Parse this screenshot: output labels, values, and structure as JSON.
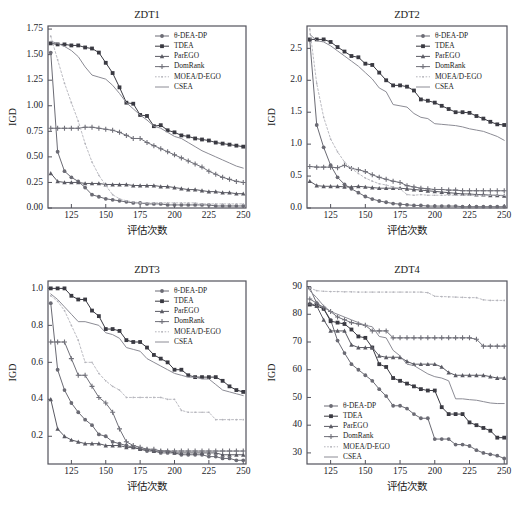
{
  "figure": {
    "axis_x_label": "评估次数",
    "axis_y_label": "IGD"
  },
  "legend": {
    "entries": [
      {
        "label": "θ-DEA-DP",
        "marker": "circle",
        "color": "#6b6b74",
        "dashed": false
      },
      {
        "label": "TDEA",
        "marker": "square",
        "color": "#3a3a42",
        "dashed": false
      },
      {
        "label": "ParEGO",
        "marker": "triangle",
        "color": "#5a5a63",
        "dashed": false
      },
      {
        "label": "DomRank",
        "marker": "plus",
        "color": "#707079",
        "dashed": false
      },
      {
        "label": "MOEA/D-EGO",
        "marker": "dot",
        "color": "#b4b4bb",
        "dashed": true
      },
      {
        "label": "CSEA",
        "marker": "none",
        "color": "#8c8c95",
        "dashed": false
      }
    ]
  },
  "chart_data": [
    {
      "type": "line",
      "title": "ZDT1",
      "xlabel": "评估次数",
      "ylabel": "IGD",
      "xlim": [
        108,
        252
      ],
      "ylim": [
        0.0,
        1.78
      ],
      "xticks": [
        125,
        150,
        175,
        200,
        225,
        250
      ],
      "yticks": [
        0.0,
        0.25,
        0.5,
        0.75,
        1.0,
        1.25,
        1.5,
        1.75
      ],
      "ytick_labels": [
        "0.00",
        "0.25",
        "0.50",
        "0.75",
        "1.00",
        "1.25",
        "1.50",
        "1.75"
      ],
      "legend_position": "top-right",
      "grid": false,
      "x": [
        110,
        115,
        120,
        125,
        130,
        135,
        140,
        145,
        150,
        155,
        160,
        165,
        170,
        175,
        180,
        185,
        190,
        195,
        200,
        205,
        210,
        215,
        220,
        225,
        230,
        235,
        240,
        245,
        250
      ],
      "series": [
        {
          "name": "θ-DEA-DP",
          "values": [
            1.52,
            0.55,
            0.36,
            0.3,
            0.26,
            0.2,
            0.13,
            0.11,
            0.09,
            0.08,
            0.07,
            0.06,
            0.05,
            0.05,
            0.04,
            0.04,
            0.04,
            0.03,
            0.03,
            0.03,
            0.03,
            0.03,
            0.03,
            0.03,
            0.02,
            0.02,
            0.02,
            0.02,
            0.02
          ]
        },
        {
          "name": "TDEA",
          "values": [
            1.61,
            1.6,
            1.6,
            1.59,
            1.59,
            1.57,
            1.56,
            1.52,
            1.42,
            1.32,
            1.18,
            1.03,
            1.02,
            0.91,
            0.9,
            0.8,
            0.81,
            0.76,
            0.74,
            0.71,
            0.7,
            0.68,
            0.67,
            0.66,
            0.64,
            0.63,
            0.62,
            0.61,
            0.6
          ]
        },
        {
          "name": "ParEGO",
          "values": [
            0.34,
            0.26,
            0.25,
            0.25,
            0.25,
            0.24,
            0.24,
            0.24,
            0.23,
            0.23,
            0.23,
            0.23,
            0.22,
            0.22,
            0.22,
            0.22,
            0.21,
            0.21,
            0.2,
            0.19,
            0.18,
            0.18,
            0.17,
            0.16,
            0.16,
            0.15,
            0.15,
            0.14,
            0.14
          ]
        },
        {
          "name": "DomRank",
          "values": [
            0.78,
            0.78,
            0.78,
            0.78,
            0.78,
            0.79,
            0.79,
            0.78,
            0.77,
            0.76,
            0.74,
            0.71,
            0.68,
            0.68,
            0.64,
            0.61,
            0.58,
            0.55,
            0.52,
            0.49,
            0.46,
            0.43,
            0.4,
            0.36,
            0.33,
            0.3,
            0.28,
            0.26,
            0.25
          ]
        },
        {
          "name": "MOEA/D-EGO",
          "values": [
            1.68,
            1.45,
            1.22,
            1.03,
            0.85,
            0.63,
            0.45,
            0.32,
            0.22,
            0.13,
            0.09,
            0.07,
            0.06,
            0.05,
            0.05,
            0.05,
            0.05,
            0.05,
            0.05,
            0.05,
            0.05,
            0.05,
            0.04,
            0.04,
            0.04,
            0.04,
            0.04,
            0.04,
            0.04
          ]
        },
        {
          "name": "CSEA",
          "values": [
            1.63,
            1.61,
            1.58,
            1.54,
            1.48,
            1.38,
            1.3,
            1.28,
            1.26,
            1.2,
            1.12,
            1.03,
            0.97,
            0.91,
            0.86,
            0.8,
            0.78,
            0.74,
            0.7,
            0.68,
            0.64,
            0.6,
            0.56,
            0.53,
            0.5,
            0.47,
            0.44,
            0.41,
            0.39
          ]
        }
      ]
    },
    {
      "type": "line",
      "title": "ZDT2",
      "xlabel": "评估次数",
      "ylabel": "IGD",
      "xlim": [
        108,
        252
      ],
      "ylim": [
        0.0,
        2.85
      ],
      "xticks": [
        125,
        150,
        175,
        200,
        225,
        250
      ],
      "yticks": [
        0.0,
        0.5,
        1.0,
        1.5,
        2.0,
        2.5
      ],
      "ytick_labels": [
        "0.0",
        "0.5",
        "1.0",
        "1.5",
        "2.0",
        "2.5"
      ],
      "legend_position": "top-right",
      "grid": false,
      "x": [
        110,
        115,
        120,
        125,
        130,
        135,
        140,
        145,
        150,
        155,
        160,
        165,
        170,
        175,
        180,
        185,
        190,
        195,
        200,
        205,
        210,
        215,
        220,
        225,
        230,
        235,
        240,
        245,
        250
      ],
      "series": [
        {
          "name": "θ-DEA-DP",
          "values": [
            2.63,
            1.3,
            0.95,
            0.67,
            0.48,
            0.37,
            0.3,
            0.24,
            0.18,
            0.14,
            0.11,
            0.09,
            0.07,
            0.06,
            0.05,
            0.04,
            0.04,
            0.03,
            0.03,
            0.03,
            0.03,
            0.03,
            0.02,
            0.02,
            0.02,
            0.02,
            0.02,
            0.02,
            0.02
          ]
        },
        {
          "name": "TDEA",
          "values": [
            2.64,
            2.64,
            2.64,
            2.6,
            2.52,
            2.45,
            2.38,
            2.36,
            2.26,
            2.24,
            2.12,
            2.0,
            1.92,
            1.92,
            1.9,
            1.84,
            1.7,
            1.68,
            1.65,
            1.6,
            1.55,
            1.5,
            1.5,
            1.49,
            1.44,
            1.4,
            1.35,
            1.31,
            1.3
          ]
        },
        {
          "name": "ParEGO",
          "values": [
            0.42,
            0.35,
            0.34,
            0.34,
            0.34,
            0.33,
            0.33,
            0.34,
            0.33,
            0.32,
            0.31,
            0.31,
            0.31,
            0.31,
            0.3,
            0.29,
            0.28,
            0.27,
            0.26,
            0.25,
            0.24,
            0.23,
            0.22,
            0.22,
            0.21,
            0.21,
            0.2,
            0.2,
            0.19
          ]
        },
        {
          "name": "DomRank",
          "values": [
            0.65,
            0.64,
            0.64,
            0.64,
            0.63,
            0.67,
            0.62,
            0.6,
            0.57,
            0.52,
            0.48,
            0.45,
            0.42,
            0.4,
            0.35,
            0.33,
            0.31,
            0.3,
            0.29,
            0.29,
            0.28,
            0.28,
            0.27,
            0.27,
            0.27,
            0.27,
            0.27,
            0.27,
            0.27
          ]
        },
        {
          "name": "MOEA/D-EGO",
          "values": [
            2.8,
            1.95,
            1.42,
            1.08,
            0.88,
            0.72,
            0.62,
            0.54,
            0.47,
            0.42,
            0.38,
            0.36,
            0.33,
            0.3,
            0.21,
            0.2,
            0.21,
            0.2,
            0.2,
            0.2,
            0.2,
            0.2,
            0.2,
            0.2,
            0.2,
            0.2,
            0.2,
            0.2,
            0.2
          ]
        },
        {
          "name": "CSEA",
          "values": [
            2.72,
            2.62,
            2.6,
            2.54,
            2.46,
            2.38,
            2.3,
            2.22,
            2.12,
            2.02,
            1.88,
            1.82,
            1.62,
            1.6,
            1.58,
            1.48,
            1.42,
            1.4,
            1.32,
            1.31,
            1.3,
            1.29,
            1.27,
            1.24,
            1.22,
            1.2,
            1.16,
            1.12,
            1.06
          ]
        }
      ]
    },
    {
      "type": "line",
      "title": "ZDT3",
      "xlabel": "评估次数",
      "ylabel": "IGD",
      "xlim": [
        108,
        252
      ],
      "ylim": [
        0.05,
        1.04
      ],
      "xticks": [
        125,
        150,
        175,
        200,
        225,
        250
      ],
      "yticks": [
        0.2,
        0.4,
        0.6,
        0.8,
        1.0
      ],
      "ytick_labels": [
        "0.2",
        "0.4",
        "0.6",
        "0.8",
        "1.0"
      ],
      "legend_position": "top-right",
      "grid": false,
      "x": [
        110,
        115,
        120,
        125,
        130,
        135,
        140,
        145,
        150,
        155,
        160,
        165,
        170,
        175,
        180,
        185,
        190,
        195,
        200,
        205,
        210,
        215,
        220,
        225,
        230,
        235,
        240,
        245,
        250
      ],
      "series": [
        {
          "name": "θ-DEA-DP",
          "values": [
            0.92,
            0.56,
            0.45,
            0.38,
            0.33,
            0.29,
            0.26,
            0.21,
            0.2,
            0.17,
            0.16,
            0.15,
            0.14,
            0.13,
            0.12,
            0.12,
            0.11,
            0.11,
            0.11,
            0.1,
            0.1,
            0.1,
            0.1,
            0.09,
            0.09,
            0.08,
            0.08,
            0.07,
            0.07
          ]
        },
        {
          "name": "TDEA",
          "values": [
            1.0,
            1.0,
            1.0,
            0.96,
            0.94,
            0.94,
            0.88,
            0.85,
            0.78,
            0.78,
            0.77,
            0.72,
            0.71,
            0.71,
            0.68,
            0.64,
            0.62,
            0.6,
            0.56,
            0.56,
            0.53,
            0.52,
            0.52,
            0.52,
            0.52,
            0.5,
            0.47,
            0.45,
            0.44
          ]
        },
        {
          "name": "ParEGO",
          "values": [
            0.4,
            0.24,
            0.2,
            0.18,
            0.17,
            0.16,
            0.16,
            0.16,
            0.15,
            0.15,
            0.15,
            0.14,
            0.14,
            0.13,
            0.13,
            0.12,
            0.12,
            0.12,
            0.11,
            0.11,
            0.11,
            0.11,
            0.11,
            0.11,
            0.11,
            0.1,
            0.1,
            0.1,
            0.1
          ]
        },
        {
          "name": "DomRank",
          "values": [
            0.71,
            0.71,
            0.71,
            0.62,
            0.53,
            0.53,
            0.47,
            0.41,
            0.38,
            0.33,
            0.24,
            0.17,
            0.15,
            0.14,
            0.13,
            0.13,
            0.12,
            0.12,
            0.12,
            0.12,
            0.12,
            0.12,
            0.12,
            0.12,
            0.12,
            0.12,
            0.12,
            0.12,
            0.12
          ]
        },
        {
          "name": "MOEA/D-EGO",
          "values": [
            0.96,
            0.93,
            0.88,
            0.8,
            0.72,
            0.6,
            0.6,
            0.54,
            0.5,
            0.47,
            0.45,
            0.41,
            0.41,
            0.41,
            0.41,
            0.41,
            0.41,
            0.4,
            0.4,
            0.34,
            0.33,
            0.33,
            0.33,
            0.33,
            0.29,
            0.29,
            0.29,
            0.29,
            0.29
          ]
        },
        {
          "name": "CSEA",
          "values": [
            0.97,
            0.94,
            0.9,
            0.86,
            0.82,
            0.82,
            0.81,
            0.8,
            0.76,
            0.75,
            0.73,
            0.68,
            0.67,
            0.66,
            0.62,
            0.6,
            0.58,
            0.56,
            0.54,
            0.53,
            0.52,
            0.52,
            0.51,
            0.51,
            0.48,
            0.45,
            0.44,
            0.43,
            0.42
          ]
        }
      ]
    },
    {
      "type": "line",
      "title": "ZDT4",
      "xlabel": "评估次数",
      "ylabel": "IGD",
      "xlim": [
        108,
        252
      ],
      "ylim": [
        26,
        92
      ],
      "xticks": [
        125,
        150,
        175,
        200,
        225,
        250
      ],
      "yticks": [
        30,
        40,
        50,
        60,
        70,
        80,
        90
      ],
      "ytick_labels": [
        "30",
        "40",
        "50",
        "60",
        "70",
        "80",
        "90"
      ],
      "legend_position": "bottom-left",
      "grid": false,
      "x": [
        110,
        115,
        120,
        125,
        130,
        135,
        140,
        145,
        150,
        155,
        160,
        165,
        170,
        175,
        180,
        185,
        190,
        195,
        200,
        205,
        210,
        215,
        220,
        225,
        230,
        235,
        240,
        245,
        250
      ],
      "series": [
        {
          "name": "θ-DEA-DP",
          "values": [
            89.5,
            84.0,
            82.0,
            78.0,
            70.5,
            66.0,
            62.0,
            60.0,
            58.0,
            56.0,
            53.0,
            50.5,
            47.0,
            47.0,
            46.0,
            44.0,
            42.5,
            42.5,
            35.0,
            35.0,
            35.0,
            33.0,
            33.0,
            32.5,
            31.0,
            30.0,
            29.5,
            29.0,
            28.0
          ]
        },
        {
          "name": "TDEA",
          "values": [
            83.5,
            83.0,
            82.0,
            77.5,
            77.0,
            76.5,
            74.5,
            72.0,
            71.5,
            68.0,
            62.0,
            61.0,
            57.0,
            56.0,
            55.0,
            54.0,
            53.0,
            52.5,
            52.5,
            46.5,
            44.0,
            44.0,
            44.0,
            41.0,
            40.0,
            39.0,
            38.0,
            35.5,
            35.5
          ]
        },
        {
          "name": "ParEGO",
          "values": [
            84.0,
            83.0,
            78.0,
            74.0,
            74.0,
            74.0,
            69.0,
            68.0,
            68.0,
            68.0,
            65.0,
            64.5,
            64.5,
            64.5,
            63.0,
            62.0,
            62.0,
            62.0,
            62.0,
            61.0,
            59.0,
            58.0,
            58.0,
            58.0,
            58.0,
            58.0,
            57.5,
            57.0,
            57.0
          ]
        },
        {
          "name": "DomRank",
          "values": [
            85.5,
            84.0,
            82.5,
            81.0,
            79.0,
            78.0,
            77.0,
            76.5,
            76.0,
            74.0,
            74.0,
            74.0,
            71.5,
            71.5,
            71.5,
            71.5,
            71.5,
            71.5,
            71.5,
            71.5,
            71.5,
            71.5,
            71.5,
            71.5,
            71.0,
            68.5,
            68.5,
            68.5,
            68.5
          ]
        },
        {
          "name": "MOEA/D-EGO",
          "values": [
            89.5,
            88.5,
            88.3,
            88.2,
            88.2,
            88.1,
            88.1,
            88.0,
            88.0,
            88.0,
            88.0,
            88.0,
            88.0,
            88.0,
            88.0,
            88.0,
            88.0,
            87.8,
            86.5,
            86.4,
            86.3,
            86.2,
            86.1,
            86.0,
            86.0,
            85.2,
            85.0,
            85.0,
            85.0
          ]
        },
        {
          "name": "CSEA",
          "values": [
            88.5,
            86.0,
            83.0,
            81.0,
            80.0,
            79.0,
            78.0,
            77.0,
            76.0,
            75.5,
            72.0,
            71.5,
            67.0,
            65.0,
            62.0,
            61.5,
            60.0,
            58.5,
            57.5,
            57.0,
            56.0,
            49.5,
            49.5,
            49.2,
            49.0,
            48.5,
            48.0,
            47.8,
            47.8
          ]
        }
      ]
    }
  ]
}
